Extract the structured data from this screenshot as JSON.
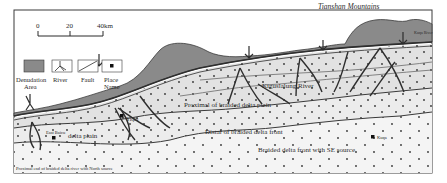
{
  "title": "Tianshan Mountains",
  "scale_bar": {
    "ticks": [
      "0",
      "20",
      "40km"
    ]
  },
  "legend": [
    {
      "icon": "denudation-area-icon",
      "label_line1": "Denudation",
      "label_line2": "Area"
    },
    {
      "icon": "river-icon",
      "label_line1": "River",
      "label_line2": ""
    },
    {
      "icon": "fault-icon",
      "label_line1": "Fault",
      "label_line2": ""
    },
    {
      "icon": "place-name-icon",
      "label_line1": "Place",
      "label_line2": "Name"
    }
  ],
  "zones": {
    "kiguslalung": "Kiguslalung River",
    "proximal": "Proximal of braided delta plain",
    "distal": "Distal of braided delta front",
    "se_source": "Braided delta front with SE source",
    "delta_plain": "delta plain",
    "provenance_bottom": "Proximal end of braided delta river with North source"
  },
  "places": {
    "east_baicu": "East Baicu",
    "yiqiu": "Yiqiu",
    "kuqa": "Kuqa",
    "kuqa_river": "Kuqa River",
    "small_river": "Kuqa River"
  },
  "colors": {
    "denudation": "#8a8a8a",
    "plain_light": "#e6e6e6",
    "plain_lighter": "#efefef",
    "front": "#f4f4f4",
    "outline": "#3a3a3a",
    "river": "#2e2e2e"
  }
}
